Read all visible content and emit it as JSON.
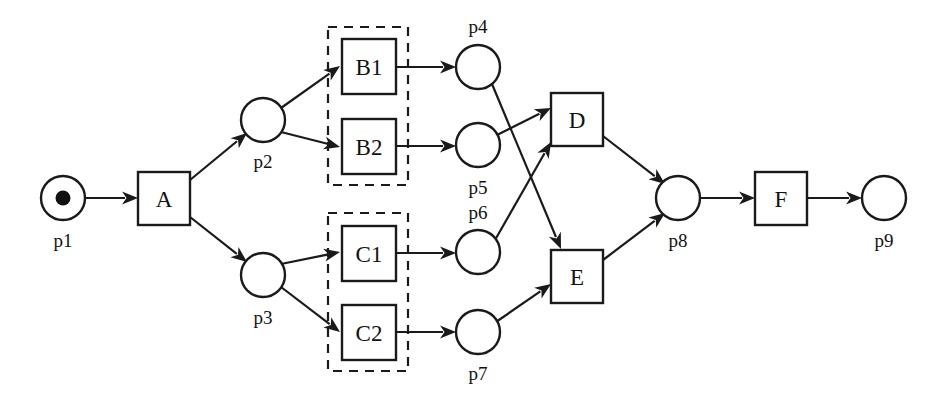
{
  "diagram": {
    "type": "petri-net",
    "title": "",
    "width": 942,
    "height": 404,
    "colors": {
      "stroke": "#1a1a1a",
      "fill": "#ffffff",
      "token": "#111111",
      "group_border": "#1a1a1a"
    },
    "places": [
      {
        "id": "p1",
        "label": "p1",
        "cx": 63,
        "cy": 198,
        "r": 22,
        "tokens": 1,
        "label_x": 63,
        "label_y": 240
      },
      {
        "id": "p2",
        "label": "p2",
        "cx": 263,
        "cy": 120,
        "r": 22,
        "tokens": 0,
        "label_x": 263,
        "label_y": 161
      },
      {
        "id": "p3",
        "label": "p3",
        "cx": 263,
        "cy": 275,
        "r": 22,
        "tokens": 0,
        "label_x": 263,
        "label_y": 317
      },
      {
        "id": "p4",
        "label": "p4",
        "cx": 478,
        "cy": 67,
        "r": 22,
        "tokens": 0,
        "label_x": 478,
        "label_y": 26
      },
      {
        "id": "p5",
        "label": "p5",
        "cx": 478,
        "cy": 145,
        "r": 22,
        "tokens": 0,
        "label_x": 478,
        "label_y": 187
      },
      {
        "id": "p6",
        "label": "p6",
        "cx": 478,
        "cy": 252,
        "r": 22,
        "tokens": 0,
        "label_x": 478,
        "label_y": 212
      },
      {
        "id": "p7",
        "label": "p7",
        "cx": 478,
        "cy": 332,
        "r": 22,
        "tokens": 0,
        "label_x": 478,
        "label_y": 373
      },
      {
        "id": "p8",
        "label": "p8",
        "cx": 678,
        "cy": 198,
        "r": 22,
        "tokens": 0,
        "label_x": 678,
        "label_y": 240
      },
      {
        "id": "p9",
        "label": "p9",
        "cx": 884,
        "cy": 198,
        "r": 22,
        "tokens": 0,
        "label_x": 884,
        "label_y": 240
      }
    ],
    "transitions": [
      {
        "id": "A",
        "label": "A",
        "x": 138,
        "y": 172,
        "w": 52,
        "h": 53
      },
      {
        "id": "B1",
        "label": "B1",
        "x": 342,
        "y": 39,
        "w": 54,
        "h": 55
      },
      {
        "id": "B2",
        "label": "B2",
        "x": 342,
        "y": 119,
        "w": 54,
        "h": 55
      },
      {
        "id": "C1",
        "label": "C1",
        "x": 342,
        "y": 226,
        "w": 54,
        "h": 55
      },
      {
        "id": "C2",
        "label": "C2",
        "x": 342,
        "y": 305,
        "w": 54,
        "h": 55
      },
      {
        "id": "D",
        "label": "D",
        "x": 551,
        "y": 93,
        "w": 52,
        "h": 53
      },
      {
        "id": "E",
        "label": "E",
        "x": 551,
        "y": 250,
        "w": 52,
        "h": 53
      },
      {
        "id": "F",
        "label": "F",
        "x": 755,
        "y": 172,
        "w": 52,
        "h": 53
      }
    ],
    "groups": [
      {
        "id": "group-b",
        "x": 328,
        "y": 27,
        "w": 80,
        "h": 158
      },
      {
        "id": "group-c",
        "x": 328,
        "y": 213,
        "w": 80,
        "h": 158
      }
    ],
    "arcs": [
      {
        "id": "p1-A",
        "from": "p1",
        "to": "A",
        "x1": 85,
        "y1": 198,
        "x2": 138,
        "y2": 198
      },
      {
        "id": "A-p2",
        "from": "A",
        "to": "p2",
        "x1": 190,
        "y1": 180,
        "x2": 247,
        "y2": 133
      },
      {
        "id": "A-p3",
        "from": "A",
        "to": "p3",
        "x1": 190,
        "y1": 217,
        "x2": 247,
        "y2": 262
      },
      {
        "id": "p2-B1",
        "from": "p2",
        "to": "B1",
        "x1": 281,
        "y1": 108,
        "x2": 340,
        "y2": 66
      },
      {
        "id": "p2-B2",
        "from": "p2",
        "to": "B2",
        "x1": 281,
        "y1": 132,
        "x2": 340,
        "y2": 147
      },
      {
        "id": "p3-C1",
        "from": "p3",
        "to": "C1",
        "x1": 281,
        "y1": 264,
        "x2": 340,
        "y2": 252
      },
      {
        "id": "p3-C2",
        "from": "p3",
        "to": "C2",
        "x1": 281,
        "y1": 287,
        "x2": 340,
        "y2": 332
      },
      {
        "id": "B1-p4",
        "from": "B1",
        "to": "p4",
        "x1": 396,
        "y1": 67,
        "x2": 456,
        "y2": 67
      },
      {
        "id": "B2-p5",
        "from": "B2",
        "to": "p5",
        "x1": 396,
        "y1": 146,
        "x2": 456,
        "y2": 146
      },
      {
        "id": "C1-p6",
        "from": "C1",
        "to": "p6",
        "x1": 396,
        "y1": 253,
        "x2": 456,
        "y2": 253
      },
      {
        "id": "C2-p7",
        "from": "C2",
        "to": "p7",
        "x1": 396,
        "y1": 332,
        "x2": 456,
        "y2": 332
      },
      {
        "id": "p4-E",
        "from": "p4",
        "to": "E",
        "x1": 492,
        "y1": 84,
        "x2": 561,
        "y2": 249
      },
      {
        "id": "p5-D",
        "from": "p5",
        "to": "D",
        "x1": 497,
        "y1": 135,
        "x2": 551,
        "y2": 108
      },
      {
        "id": "p6-D",
        "from": "p6",
        "to": "D",
        "x1": 495,
        "y1": 240,
        "x2": 551,
        "y2": 142
      },
      {
        "id": "p7-E",
        "from": "p7",
        "to": "E",
        "x1": 496,
        "y1": 322,
        "x2": 551,
        "y2": 284
      },
      {
        "id": "D-p8",
        "from": "D",
        "to": "p8",
        "x1": 603,
        "y1": 136,
        "x2": 665,
        "y2": 184
      },
      {
        "id": "E-p8",
        "from": "E",
        "to": "p8",
        "x1": 603,
        "y1": 260,
        "x2": 665,
        "y2": 213
      },
      {
        "id": "p8-F",
        "from": "p8",
        "to": "F",
        "x1": 700,
        "y1": 198,
        "x2": 755,
        "y2": 198
      },
      {
        "id": "F-p9",
        "from": "F",
        "to": "p9",
        "x1": 807,
        "y1": 198,
        "x2": 862,
        "y2": 198
      }
    ]
  }
}
